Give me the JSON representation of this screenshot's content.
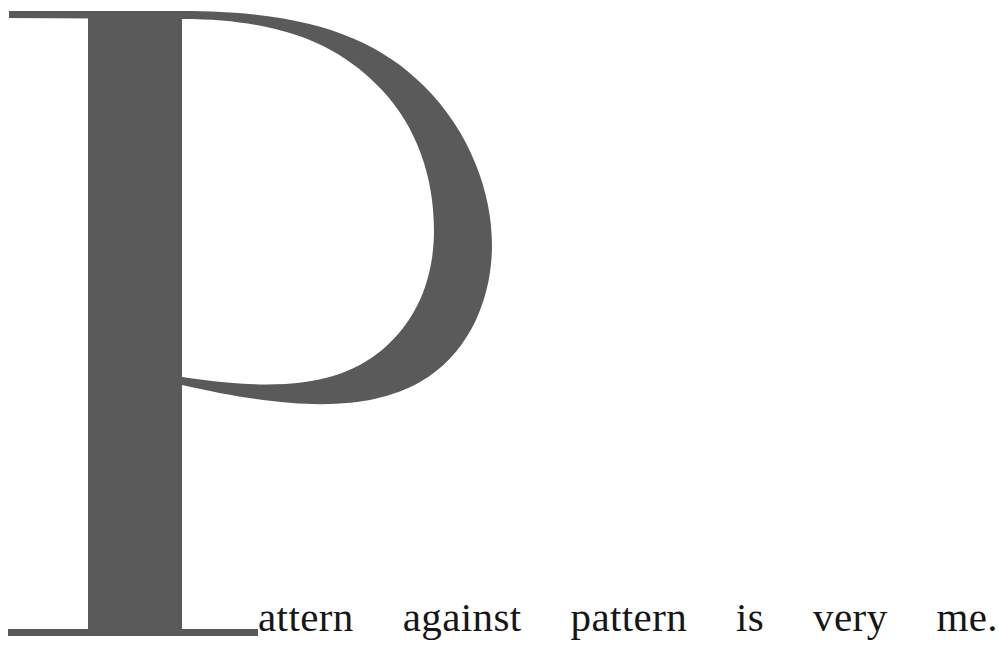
{
  "page": {
    "width": 999,
    "height": 649,
    "background_color": "#ffffff",
    "kind": "pull-quote-with-drop-cap"
  },
  "colors": {
    "drop_cap_gray": "#5a5a5a",
    "text_black": "#161616",
    "background": "#ffffff"
  },
  "drop_cap": {
    "letter": "P",
    "color": "#5a5a5a",
    "style": "didone-serif",
    "role": "initial-capital"
  },
  "quote": {
    "full_text": "Pattern against pattern is very me.",
    "run_in_text": "attern against pattern is very me.",
    "alignment": "justified",
    "color": "#161616",
    "words": [
      "attern",
      "against",
      "pattern",
      "is",
      "very",
      "me."
    ]
  }
}
